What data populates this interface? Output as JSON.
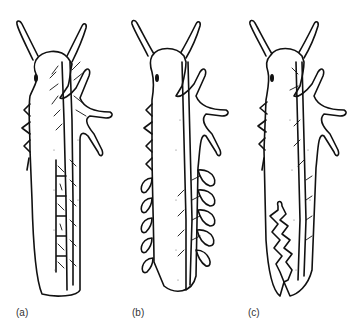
{
  "figure": {
    "panels": [
      {
        "id": "a",
        "label": "(a)",
        "description": "body with segmented internal tracheal compartments along abdomen"
      },
      {
        "id": "b",
        "label": "(b)",
        "description": "body with paired lateral leaf-like tracheal gills along abdomen"
      },
      {
        "id": "c",
        "label": "(c)",
        "description": "body with internal rectal/branched gill structure in posterior abdomen"
      }
    ],
    "colors": {
      "ink": "#111111",
      "background": "#ffffff",
      "label": "#333333"
    }
  }
}
